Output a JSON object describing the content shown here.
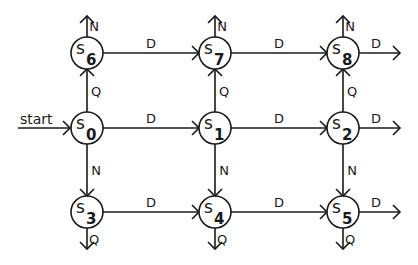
{
  "diagram": {
    "type": "state-machine",
    "colors": {
      "stroke": "#1a1a1a",
      "background": "#ffffff"
    },
    "start": {
      "label": "start",
      "target": "s0"
    },
    "nodes": [
      {
        "id": "s6",
        "prefix": "s",
        "sub": "6",
        "x": 87,
        "y": 53
      },
      {
        "id": "s7",
        "prefix": "s",
        "sub": "7",
        "x": 215,
        "y": 53
      },
      {
        "id": "s8",
        "prefix": "s",
        "sub": "8",
        "x": 343,
        "y": 53
      },
      {
        "id": "s0",
        "prefix": "s",
        "sub": "0",
        "x": 87,
        "y": 128
      },
      {
        "id": "s1",
        "prefix": "s",
        "sub": "1",
        "x": 215,
        "y": 128
      },
      {
        "id": "s2",
        "prefix": "s",
        "sub": "2",
        "x": 343,
        "y": 128
      },
      {
        "id": "s3",
        "prefix": "s",
        "sub": "3",
        "x": 87,
        "y": 212
      },
      {
        "id": "s4",
        "prefix": "s",
        "sub": "4",
        "x": 215,
        "y": 212
      },
      {
        "id": "s5",
        "prefix": "s",
        "sub": "5",
        "x": 343,
        "y": 212
      }
    ],
    "edges": [
      {
        "from": "s6",
        "to": "s7",
        "label": "D"
      },
      {
        "from": "s7",
        "to": "s8",
        "label": "D"
      },
      {
        "from": "s0",
        "to": "s1",
        "label": "D"
      },
      {
        "from": "s1",
        "to": "s2",
        "label": "D"
      },
      {
        "from": "s3",
        "to": "s4",
        "label": "D"
      },
      {
        "from": "s4",
        "to": "s5",
        "label": "D"
      },
      {
        "from": "s0",
        "to": "s6",
        "label": "Q"
      },
      {
        "from": "s1",
        "to": "s7",
        "label": "Q"
      },
      {
        "from": "s2",
        "to": "s8",
        "label": "Q"
      },
      {
        "from": "s0",
        "to": "s3",
        "label": "N"
      },
      {
        "from": "s1",
        "to": "s4",
        "label": "N"
      },
      {
        "from": "s2",
        "to": "s5",
        "label": "N"
      }
    ],
    "exits": [
      {
        "from": "s6",
        "dir": "up",
        "label": "N"
      },
      {
        "from": "s7",
        "dir": "up",
        "label": "N"
      },
      {
        "from": "s8",
        "dir": "up",
        "label": "N"
      },
      {
        "from": "s8",
        "dir": "right",
        "label": "D"
      },
      {
        "from": "s2",
        "dir": "right",
        "label": "D"
      },
      {
        "from": "s5",
        "dir": "right",
        "label": "D"
      },
      {
        "from": "s3",
        "dir": "down",
        "label": "Q"
      },
      {
        "from": "s4",
        "dir": "down",
        "label": "Q"
      },
      {
        "from": "s5",
        "dir": "down",
        "label": "Q"
      }
    ]
  }
}
